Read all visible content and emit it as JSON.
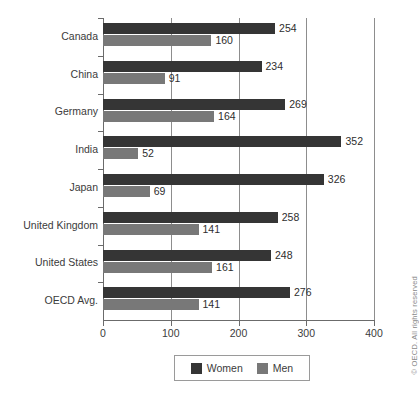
{
  "chart_data": {
    "type": "bar",
    "orientation": "horizontal",
    "title": "",
    "subtitle": "",
    "xlabel": "",
    "ylabel": "",
    "categories": [
      "Canada",
      "China",
      "Germany",
      "India",
      "Japan",
      "United Kingdom",
      "United States",
      "OECD Avg."
    ],
    "series": [
      {
        "name": "Women",
        "color": "#353535",
        "values": [
          254,
          234,
          269,
          352,
          326,
          258,
          248,
          276
        ]
      },
      {
        "name": "Men",
        "color": "#787878",
        "values": [
          160,
          91,
          164,
          52,
          69,
          141,
          161,
          141
        ]
      }
    ],
    "xlim": [
      0,
      400
    ],
    "xticks": [
      0,
      100,
      200,
      300,
      400
    ],
    "xticklabels": [
      "0",
      "100",
      "200",
      "300",
      "400"
    ],
    "grid": true,
    "grid_axis": "x",
    "data_labels": true,
    "legend": {
      "position": "bottom",
      "entries": [
        {
          "label": "Women",
          "color": "#353535"
        },
        {
          "label": "Men",
          "color": "#787878"
        }
      ]
    }
  },
  "footer": {
    "copyright": "© OECD. All rights reserved"
  }
}
